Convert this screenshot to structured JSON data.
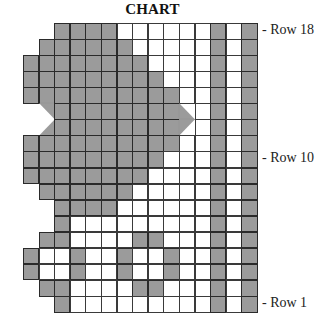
{
  "title": "CHART",
  "colors": {
    "filled": "#9b9b9b",
    "empty": "#ffffff",
    "line": "#2a2a2a"
  },
  "grid": {
    "columns": 15,
    "rows": 18,
    "legend": {
      "G": "filled (gray) stitch",
      "W": "blank (white) stitch",
      "_": "no stitch",
      "a": "half stitch upper-right",
      "b": "half stitch lower-left",
      "c": "half stitch lower-right",
      "d": "half stitch upper-left"
    },
    "rows_top_to_bottom": [
      {
        "row": 18,
        "cells": "__GGGGWWWWWWGWG"
      },
      {
        "row": 17,
        "cells": "_GGGGGGWWWWWGWG"
      },
      {
        "row": 16,
        "cells": "GGGGGGGGWWWWGWG"
      },
      {
        "row": 15,
        "cells": "GGGGGGGGGWWWGWG"
      },
      {
        "row": 14,
        "cells": "GGGGGGGGGGWWGWG"
      },
      {
        "row": 13,
        "cells": "_aGGGGGGGGbWGWG"
      },
      {
        "row": 12,
        "cells": "_cGGGGGGGGdWGWG"
      },
      {
        "row": 11,
        "cells": "GGGGGGGGGGWWGWG"
      },
      {
        "row": 10,
        "cells": "GGGGGGGGGWWWGWG"
      },
      {
        "row": 9,
        "cells": "GGGGGGGGWWWWGWG"
      },
      {
        "row": 8,
        "cells": "_GGGGGGWWWWWGWG"
      },
      {
        "row": 7,
        "cells": "__GGGGWWWWWWGWG"
      },
      {
        "row": 6,
        "cells": "__GWWWWWWWWWGWG"
      },
      {
        "row": 5,
        "cells": "_GGWWWWGGWWWGWG"
      },
      {
        "row": 4,
        "cells": "GWWGWWGWWGWWGWG"
      },
      {
        "row": 3,
        "cells": "GWWGWWGWWGWWGWG"
      },
      {
        "row": 2,
        "cells": "_GGWWWWGGWWWGWG"
      },
      {
        "row": 1,
        "cells": "__GWWWWWWWWWGWG"
      }
    ]
  },
  "row_labels": [
    {
      "row": 18,
      "text": "- Row 18"
    },
    {
      "row": 10,
      "text": "- Row 10"
    },
    {
      "row": 1,
      "text": "- Row 1"
    }
  ]
}
